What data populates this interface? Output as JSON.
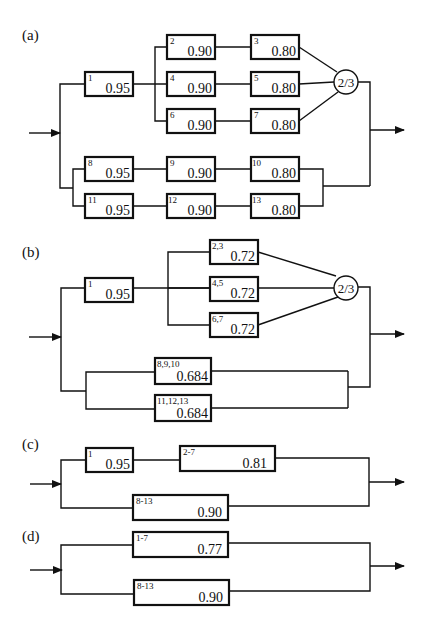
{
  "panels": {
    "a": {
      "label": "(a)",
      "blocks": [
        {
          "id": "1",
          "value": "0.95"
        },
        {
          "id": "2",
          "value": "0.90"
        },
        {
          "id": "3",
          "value": "0.80"
        },
        {
          "id": "4",
          "value": "0.90"
        },
        {
          "id": "5",
          "value": "0.80"
        },
        {
          "id": "6",
          "value": "0.90"
        },
        {
          "id": "7",
          "value": "0.80"
        },
        {
          "id": "8",
          "value": "0.95"
        },
        {
          "id": "9",
          "value": "0.90"
        },
        {
          "id": "10",
          "value": "0.80"
        },
        {
          "id": "11",
          "value": "0.95"
        },
        {
          "id": "12",
          "value": "0.90"
        },
        {
          "id": "13",
          "value": "0.80"
        }
      ],
      "voter": "2/3"
    },
    "b": {
      "label": "(b)",
      "blocks": [
        {
          "id": "1",
          "value": "0.95"
        },
        {
          "id": "2,3",
          "value": "0.72"
        },
        {
          "id": "4,5",
          "value": "0.72"
        },
        {
          "id": "6,7",
          "value": "0.72"
        },
        {
          "id": "8,9,10",
          "value": "0.684"
        },
        {
          "id": "11,12,13",
          "value": "0.684"
        }
      ],
      "voter": "2/3"
    },
    "c": {
      "label": "(c)",
      "blocks": [
        {
          "id": "1",
          "value": "0.95"
        },
        {
          "id": "2-7",
          "value": "0.81"
        },
        {
          "id": "8-13",
          "value": "0.90"
        }
      ]
    },
    "d": {
      "label": "(d)",
      "blocks": [
        {
          "id": "1-7",
          "value": "0.77"
        },
        {
          "id": "8-13",
          "value": "0.90"
        }
      ]
    }
  }
}
